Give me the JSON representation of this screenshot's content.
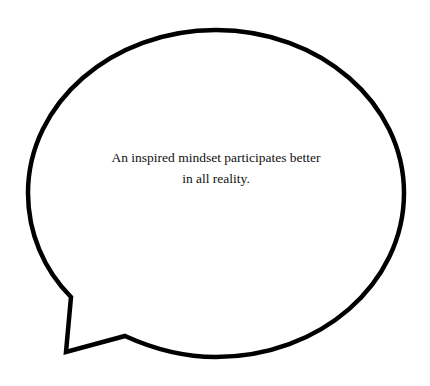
{
  "speech_bubble": {
    "quote_line1": "An inspired mindset participates better",
    "quote_line2": "in all reality.",
    "stroke_color": "#000000",
    "fill_color": "#ffffff"
  }
}
